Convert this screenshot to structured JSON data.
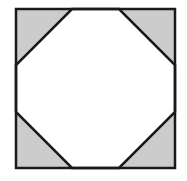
{
  "diagram": {
    "type": "geometric-figure",
    "square": {
      "x": 16,
      "y": 9,
      "size": 159
    },
    "corner_cut": 56,
    "shade_color": "#cccccc",
    "stroke_color": "#1a1a1a",
    "corners": [
      "top-left",
      "top-right",
      "bottom-left",
      "bottom-right"
    ]
  }
}
